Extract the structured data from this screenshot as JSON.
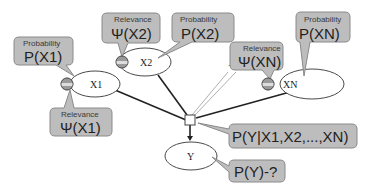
{
  "diagram": {
    "nodes": {
      "x1": {
        "label": "X1"
      },
      "x2": {
        "label": "X2"
      },
      "xn": {
        "label": "XN"
      },
      "y": {
        "label": "Y"
      },
      "ellipsis": {
        "label": "..."
      }
    },
    "callouts": {
      "prob_x1": {
        "title": "Probability",
        "formula": "P(X1)"
      },
      "rel_x1": {
        "title": "Relevance",
        "formula": "Ψ(X1)"
      },
      "rel_x2": {
        "title": "Relevance",
        "formula": "Ψ(X2)"
      },
      "prob_x2": {
        "title": "Probability",
        "formula": "P(X2)"
      },
      "rel_xn": {
        "title": "Relevance",
        "formula": "Ψ(XN)"
      },
      "prob_xn": {
        "title": "Probability",
        "formula": "P(XN)"
      },
      "conditional": {
        "formula": "P(Y|X1,X2,...,XN)"
      },
      "target": {
        "formula": "P(Y)-?"
      }
    },
    "colors": {
      "callout_fill": "#bdbdbd",
      "callout_stroke": "#8a8a8a",
      "edge": "#222222",
      "node_stroke": "#4a4a4a"
    }
  }
}
